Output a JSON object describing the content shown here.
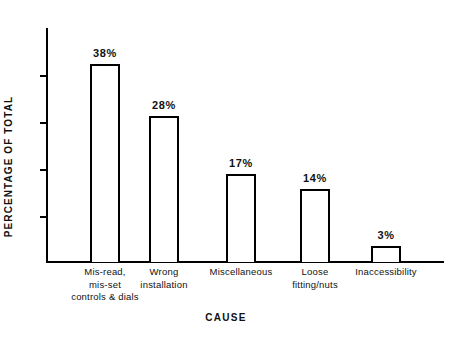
{
  "chart_data": {
    "type": "bar",
    "title": "",
    "xlabel": "CAUSE",
    "ylabel": "PERCENTAGE OF TOTAL",
    "ylim": [
      0,
      45
    ],
    "grid": false,
    "legend": "none",
    "y_tick_labels": [],
    "y_tick_count": 4,
    "categories": [
      "Mis-read, mis-set controls & dials",
      "Wrong installation",
      "Miscellaneous",
      "Loose fitting/nuts",
      "Inaccessibility"
    ],
    "values": [
      38,
      28,
      17,
      14,
      3
    ],
    "value_labels": [
      "38%",
      "28%",
      "17%",
      "14%",
      "3%"
    ],
    "bar_fill": "#ffffff",
    "bar_stroke": "#000000",
    "axis_color": "#000000",
    "bars": [
      {
        "value": 38,
        "value_label": "38%",
        "label_lines": [
          "Mis-read,",
          "mis-set",
          "controls & dials"
        ]
      },
      {
        "value": 28,
        "value_label": "28%",
        "label_lines": [
          "Wrong",
          "installation"
        ]
      },
      {
        "value": 17,
        "value_label": "17%",
        "label_lines": [
          "Miscellaneous"
        ]
      },
      {
        "value": 14,
        "value_label": "14%",
        "label_lines": [
          "Loose",
          "fitting/nuts"
        ]
      },
      {
        "value": 3,
        "value_label": "3%",
        "label_lines": [
          "Inaccessibility"
        ]
      }
    ]
  }
}
